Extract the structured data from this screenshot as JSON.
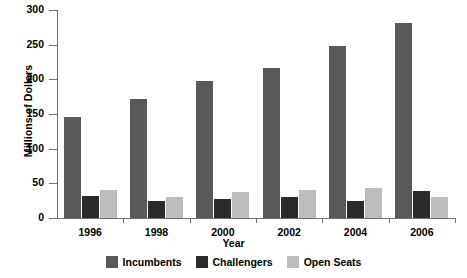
{
  "chart_data": {
    "type": "bar",
    "title": "",
    "xlabel": "Year",
    "ylabel": "Millions of Dollars",
    "categories": [
      "1996",
      "1998",
      "2000",
      "2002",
      "2004",
      "2006"
    ],
    "series": [
      {
        "name": "Incumbents",
        "color": "#595959",
        "values": [
          146,
          172,
          197,
          216,
          248,
          281
        ]
      },
      {
        "name": "Challengers",
        "color": "#2b2b2b",
        "values": [
          32,
          24,
          28,
          31,
          25,
          39
        ]
      },
      {
        "name": "Open Seats",
        "color": "#bdbdbd",
        "values": [
          40,
          30,
          38,
          41,
          44,
          31
        ]
      }
    ],
    "ylim": [
      0,
      300
    ],
    "yticks": [
      0,
      50,
      100,
      150,
      200,
      250,
      300
    ],
    "ytick_labels": [
      "0",
      "50",
      "100",
      "150",
      "200",
      "250",
      "300"
    ],
    "grid": false,
    "legend_position": "bottom-center"
  }
}
